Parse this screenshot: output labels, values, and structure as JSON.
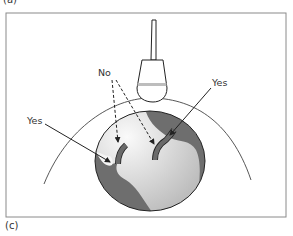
{
  "panel_labels": {
    "top": "(a)",
    "bottom": "(c)"
  },
  "annotations": {
    "no": "No",
    "yes_left": "Yes",
    "yes_right": "Yes"
  },
  "colors": {
    "frame": "#8a8a8a",
    "organ_dark": "#6e6e6e",
    "organ_light": "#d9d9d9",
    "lesion_light": "#f4f4f4",
    "vessel": "#6a6a6a",
    "probe_band": "#bdbdbd",
    "line": "#222222"
  },
  "diagram": {
    "items": [
      "ultrasound-probe",
      "skin-surface-arc",
      "organ",
      "vessel-left",
      "vessel-right"
    ]
  }
}
